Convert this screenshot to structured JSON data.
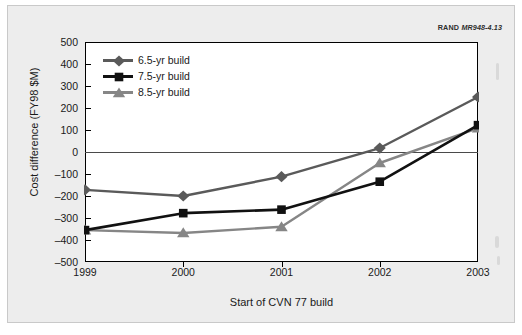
{
  "figure": {
    "source_credit_org": "RAND",
    "source_credit_id": "MR948-4.13"
  },
  "chart_data": {
    "type": "line",
    "title": "",
    "xlabel": "Start of CVN 77 build",
    "ylabel": "Cost difference (FY98 $M)",
    "categories": [
      "1999",
      "2000",
      "2001",
      "2002",
      "2003"
    ],
    "x": [
      1999,
      2000,
      2001,
      2002,
      2003
    ],
    "ylim": [
      -500,
      500
    ],
    "yticks": [
      500,
      400,
      300,
      200,
      100,
      0,
      -100,
      -200,
      -300,
      -400,
      -500
    ],
    "ytick_labels": [
      "500",
      "400",
      "300",
      "200",
      "100",
      "0",
      "-100",
      "-200",
      "-300",
      "-400",
      "-500"
    ],
    "grid": false,
    "zero_line": true,
    "legend_position": "upper-left-inside",
    "series": [
      {
        "name": "6.5-yr build",
        "marker": "diamond",
        "color": "#5a5a5a",
        "values": [
          -172,
          -200,
          -112,
          18,
          250
        ]
      },
      {
        "name": "7.5-yr build",
        "marker": "square",
        "color": "#111111",
        "values": [
          -355,
          -278,
          -262,
          -135,
          122
        ]
      },
      {
        "name": "8.5-yr build",
        "marker": "triangle",
        "color": "#868686",
        "values": [
          -355,
          -368,
          -340,
          -50,
          108
        ]
      }
    ]
  }
}
